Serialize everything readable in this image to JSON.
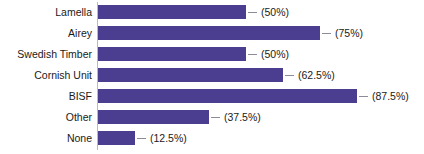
{
  "chart_data": {
    "type": "bar",
    "orientation": "horizontal",
    "title": "",
    "xlabel": "",
    "ylabel": "",
    "grid": false,
    "legend": null,
    "xlim": [
      0,
      100
    ],
    "categories": [
      "Lamella",
      "Airey",
      "Swedish Timber",
      "Cornish Unit",
      "BISF",
      "Other",
      "None"
    ],
    "values": [
      50,
      75,
      50,
      62.5,
      87.5,
      37.5,
      12.5
    ],
    "value_labels": [
      "(50%)",
      "(75%)",
      "(50%)",
      "(62.5%)",
      "(87.5%)",
      "(37.5%)",
      "(12.5%)"
    ],
    "bar_color": "#4b3e90",
    "axis_color": "#b9b9c4",
    "text_color": "#1a1a1a",
    "background": "#ffffff"
  },
  "rows": [
    {
      "label": "Lamella",
      "value": 50,
      "value_label": "(50%)"
    },
    {
      "label": "Airey",
      "value": 75,
      "value_label": "(75%)"
    },
    {
      "label": "Swedish Timber",
      "value": 50,
      "value_label": "(50%)"
    },
    {
      "label": "Cornish Unit",
      "value": 62.5,
      "value_label": "(62.5%)"
    },
    {
      "label": "BISF",
      "value": 87.5,
      "value_label": "(87.5%)"
    },
    {
      "label": "Other",
      "value": 37.5,
      "value_label": "(37.5%)"
    },
    {
      "label": "None",
      "value": 12.5,
      "value_label": "(12.5%)"
    }
  ]
}
